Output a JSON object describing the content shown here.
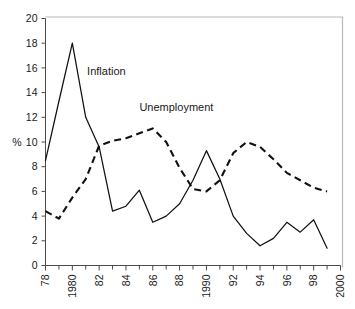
{
  "chart_data": {
    "type": "line",
    "title": "",
    "xlabel": "",
    "ylabel": "%",
    "ylim": [
      0,
      20
    ],
    "xlim": [
      1978,
      2000
    ],
    "ytick_step": 2,
    "grid": false,
    "legend_position": "inline-annotation",
    "yticks": [
      "0",
      "2",
      "4",
      "6",
      "8",
      "10",
      "12",
      "14",
      "16",
      "18",
      "20"
    ],
    "x": [
      1978,
      1979,
      1980,
      1981,
      1982,
      1983,
      1984,
      1985,
      1986,
      1987,
      1988,
      1989,
      1990,
      1991,
      1992,
      1993,
      1994,
      1995,
      1996,
      1997,
      1998,
      1999
    ],
    "xtick_values": [
      1978,
      1980,
      1982,
      1984,
      1986,
      1988,
      1990,
      1992,
      1994,
      1996,
      1998,
      2000
    ],
    "xtick_labels": [
      "78",
      "1980",
      "82",
      "84",
      "86",
      "88",
      "1990",
      "92",
      "94",
      "96",
      "98",
      "2000"
    ],
    "xtick_minor_values": [
      1979,
      1981,
      1983,
      1985,
      1987,
      1989,
      1991,
      1993,
      1995,
      1997,
      1999
    ],
    "series": [
      {
        "name": "Inflation",
        "style": "solid",
        "label_x": 1981.1,
        "label_y": 15.4,
        "values": [
          8.5,
          13.3,
          18.0,
          12.0,
          9.6,
          4.4,
          4.8,
          6.1,
          3.5,
          4.0,
          5.0,
          6.9,
          9.3,
          7.0,
          4.0,
          2.6,
          1.6,
          2.2,
          3.5,
          2.7,
          3.7,
          1.4
        ]
      },
      {
        "name": "Unemployment",
        "style": "dashed",
        "label_x": 1985.0,
        "label_y": 12.5,
        "values": [
          4.4,
          3.8,
          5.5,
          7.0,
          9.7,
          10.1,
          10.3,
          10.7,
          11.1,
          10.0,
          7.9,
          6.2,
          6.0,
          6.9,
          9.1,
          10.0,
          9.6,
          8.6,
          7.5,
          6.9,
          6.3,
          6.0
        ]
      }
    ]
  },
  "annotations": {
    "inflation_label": "Inflation",
    "unemployment_label": "Unemployment",
    "y_axis_label": "%"
  }
}
